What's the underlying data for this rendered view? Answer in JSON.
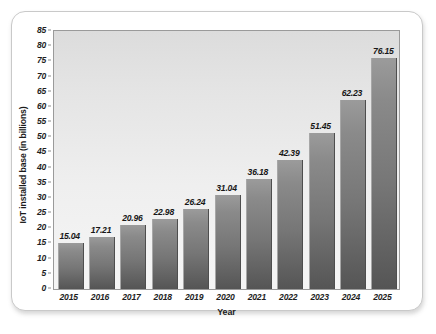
{
  "chart_data": {
    "type": "bar",
    "title": "",
    "xlabel": "Year",
    "ylabel": "IoT installed base (in billions)",
    "categories": [
      "2015",
      "2016",
      "2017",
      "2018",
      "2019",
      "2020",
      "2021",
      "2022",
      "2023",
      "2024",
      "2025"
    ],
    "values": [
      15.04,
      17.21,
      20.96,
      22.98,
      26.24,
      31.04,
      36.18,
      42.39,
      51.45,
      62.23,
      76.15
    ],
    "value_labels": [
      "15.04",
      "17.21",
      "20.96",
      "22.98",
      "26.24",
      "31.04",
      "36.18",
      "42.39",
      "51.45",
      "62.23",
      "76.15"
    ],
    "ylim": [
      0,
      85
    ],
    "ytick_step": 5,
    "yticks": [
      "0",
      "5",
      "10",
      "15",
      "20",
      "25",
      "30",
      "35",
      "40",
      "45",
      "50",
      "55",
      "60",
      "65",
      "70",
      "75",
      "80",
      "85"
    ],
    "grid": false,
    "legend": "none",
    "series": [
      {
        "name": "IoT installed base",
        "values": [
          15.04,
          17.21,
          20.96,
          22.98,
          26.24,
          31.04,
          36.18,
          42.39,
          51.45,
          62.23,
          76.15
        ]
      }
    ],
    "colors": {
      "bar_top": "#9b9b9b",
      "bar_bottom": "#555555",
      "plot_background_top": "#dcdcdc",
      "plot_background_bottom": "#f5f5f5",
      "axis_line": "#9a9a9a",
      "text": "#1e1e1e",
      "card_background": "#ffffff",
      "card_border": "#c9c9c9"
    }
  }
}
